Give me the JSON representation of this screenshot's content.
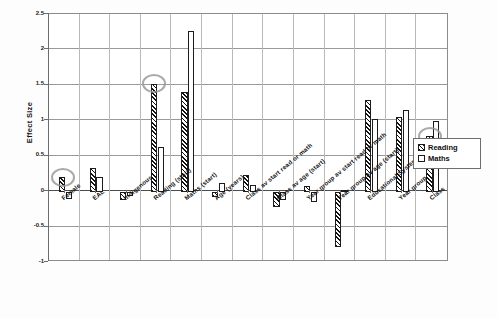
{
  "chart_data": {
    "type": "bar",
    "title": "",
    "xlabel": "",
    "ylabel": "Effect Size",
    "ylim": [
      -1,
      2.5
    ],
    "ytick_labels": [
      "2.5",
      "2",
      "1.5",
      "1",
      "0.5",
      "0",
      "-0.5",
      "-1"
    ],
    "ytick_values": [
      2.5,
      2,
      1.5,
      1,
      0.5,
      0,
      -0.5,
      -1
    ],
    "grid": true,
    "legend_position": "right-middle",
    "categories": [
      "Female",
      "EAL",
      "Indigenous",
      "Reading (start)",
      "Maths (start)",
      "Age (years)",
      "Class av start read or math",
      "Class av age (start)",
      "Year group av start read or math",
      "Year group av age (start)",
      "Educational System",
      "Year group",
      "Class"
    ],
    "series": [
      {
        "name": "Reading",
        "pattern": "diagonal-hatch",
        "values": [
          0.2,
          0.33,
          -0.12,
          1.52,
          1.4,
          -0.07,
          0.24,
          -0.21,
          0.08,
          -0.78,
          1.29,
          1.05,
          0.78
        ]
      },
      {
        "name": "Maths",
        "pattern": "white-fill",
        "values": [
          -0.11,
          0.2,
          -0.06,
          0.63,
          2.27,
          0.12,
          0.1,
          -0.12,
          -0.14,
          0.02,
          1.03,
          1.15,
          1.0
        ]
      }
    ],
    "annotations": [
      {
        "label": "highlight-female-reading",
        "category": "Female",
        "series": "Reading",
        "value": 0.2
      },
      {
        "label": "highlight-reading-start-reading",
        "category": "Reading (start)",
        "series": "Reading",
        "value": 1.52
      },
      {
        "label": "highlight-class-reading",
        "category": "Class",
        "series": "Reading",
        "value": 0.78
      }
    ]
  },
  "legend": {
    "items": [
      {
        "label": "Reading",
        "key": "reading"
      },
      {
        "label": "Maths",
        "key": "maths"
      }
    ]
  },
  "colors": {
    "axis": "#6b6b6b",
    "grid": "#9a9a9a",
    "bar_outline": "#1c1c1c",
    "hatch": "#111111",
    "fill": "#ffffff",
    "highlight": "#9a9a9a",
    "text": "#101010"
  }
}
